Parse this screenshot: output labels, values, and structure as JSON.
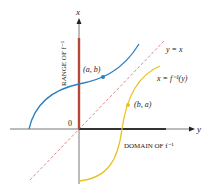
{
  "diagram": {
    "axes": {
      "vertical_label": "x",
      "horizontal_label": "y",
      "origin_label": "0"
    },
    "curves": {
      "f": {
        "color": "#2a7fc0",
        "point_label": "(a, b)"
      },
      "f_inverse": {
        "color": "#e8c22a",
        "point_label": "(b, a)",
        "equation_label": "x = f⁻¹(y)"
      },
      "identity": {
        "color": "#e08a8a",
        "equation_label": "y = x"
      }
    },
    "range_label": "RANGE OF f⁻¹",
    "domain_label": "DOMAIN OF f⁻¹",
    "range_color": "#b5483a",
    "domain_color": "#333333"
  }
}
